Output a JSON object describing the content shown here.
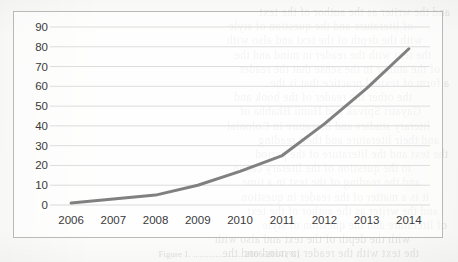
{
  "chart_data": {
    "type": "line",
    "title": "",
    "xlabel": "",
    "ylabel": "",
    "categories": [
      "2006",
      "2007",
      "2008",
      "2009",
      "2010",
      "2011",
      "2012",
      "2013",
      "2014"
    ],
    "x": [
      2006,
      2007,
      2008,
      2009,
      2010,
      2011,
      2012,
      2013,
      2014
    ],
    "values": [
      1,
      3,
      5,
      10,
      17,
      25,
      41,
      59,
      79
    ],
    "series": [
      {
        "name": "series-1",
        "values": [
          1,
          3,
          5,
          10,
          17,
          25,
          41,
          59,
          79
        ],
        "color": "#808080"
      }
    ],
    "ylim": [
      0,
      90
    ],
    "yticks": [
      0,
      10,
      20,
      30,
      40,
      50,
      60,
      70,
      80,
      90
    ],
    "ytick_labels": [
      "0",
      "10",
      "20",
      "30",
      "40",
      "50",
      "60",
      "70",
      "80",
      "90"
    ],
    "xtick_labels": [
      "2006",
      "2007",
      "2008",
      "2009",
      "2010",
      "2011",
      "2012",
      "2013",
      "2014"
    ],
    "grid": "horizontal",
    "legend": "none",
    "line_color": "#808080",
    "line_width": 3,
    "markers": false,
    "plot_border": true,
    "grid_color": "#d9d9d9",
    "background": "#ffffff"
  },
  "caption": {
    "text": "Figure 1. ...................... 2006-2014 (%)"
  },
  "bleed_text": {
    "lines": [
      "and the writer as the author of the text",
      "of literature and the question of style",
      "with the depth of the text and also with",
      "the text with the reader in mind and the",
      "of the author in the sense that the reader",
      "a form of textual practice that is the",
      "the other the reader of the book and",
      "Gayatri Spivak and Homi Bhabha of",
      "literary studies and literature in Colonial",
      "and their literature and their reading",
      "the text and the literature of the period",
      "to the question of the literary canon",
      "and the reading of the text in a time",
      "it is a matter of the reader in question"
    ]
  }
}
